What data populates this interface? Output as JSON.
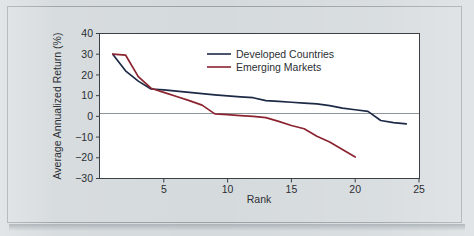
{
  "figure": {
    "background_color": "#d5dadd",
    "plot_background_color": "#ffffff",
    "border_color": "#9aa2a8"
  },
  "chart_data": {
    "type": "line",
    "title": "",
    "xlabel": "Rank",
    "ylabel": "Average Annualized Return (%)",
    "xlim": [
      0,
      25
    ],
    "ylim": [
      -30,
      40
    ],
    "xticks": [
      5,
      10,
      15,
      20,
      25
    ],
    "xtick_labels": [
      "5",
      "10",
      "15",
      "20",
      "25"
    ],
    "yticks": [
      -30,
      -20,
      -10,
      0,
      10,
      20,
      30,
      40
    ],
    "ytick_labels": [
      "-30",
      "-20",
      "-10",
      "0",
      "10",
      "20",
      "30",
      "40"
    ],
    "grid": false,
    "zero_line": true,
    "legend_position": "upper-center",
    "series": [
      {
        "name": "Developed Countries",
        "color": "#1d2a46",
        "x": [
          1,
          2,
          3,
          4,
          5,
          6,
          7,
          8,
          9,
          10,
          11,
          12,
          13,
          14,
          15,
          16,
          17,
          18,
          19,
          20,
          21,
          22,
          23,
          24
        ],
        "values": [
          30.0,
          22.0,
          17.0,
          13.2,
          12.8,
          12.2,
          11.6,
          11.0,
          10.4,
          9.9,
          9.4,
          9.0,
          7.6,
          7.2,
          6.8,
          6.4,
          6.0,
          5.2,
          4.0,
          3.2,
          2.4,
          -2.0,
          -3.0,
          -3.6
        ]
      },
      {
        "name": "Emerging Markets",
        "color": "#8b2430",
        "x": [
          1,
          2,
          3,
          4,
          5,
          6,
          7,
          8,
          9,
          10,
          11,
          12,
          13,
          14,
          15,
          16,
          17,
          18,
          19,
          20
        ],
        "values": [
          30.0,
          29.6,
          19.2,
          13.6,
          11.6,
          9.6,
          7.6,
          5.4,
          1.2,
          0.8,
          0.4,
          0.0,
          -0.6,
          -2.4,
          -4.4,
          -6.0,
          -9.6,
          -12.4,
          -16.0,
          -19.6
        ]
      }
    ]
  },
  "legend": {
    "entries": [
      {
        "label": "Developed Countries",
        "color": "#1d2a46"
      },
      {
        "label": "Emerging Markets",
        "color": "#8b2430"
      }
    ]
  }
}
